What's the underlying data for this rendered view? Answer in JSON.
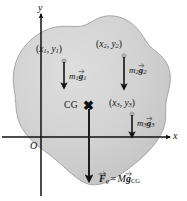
{
  "figure": {
    "background_color": "#ffffff",
    "body_fill_color": "#cccccc",
    "body_edge_color": "#9a9a9a",
    "axis_color": "#111111",
    "vector_color": "#141414"
  },
  "axes": {
    "y_label": "y",
    "x_label": "x",
    "origin_label": "O"
  },
  "cg": {
    "label": "CG",
    "marker": "✖"
  },
  "particles": [
    {
      "id": "particle-1",
      "coord_open": "(",
      "coord_x": "x",
      "coord_x_sub": "1",
      "coord_comma": ", ",
      "coord_y": "y",
      "coord_y_sub": "1",
      "coord_close": ")",
      "force_mass": "m",
      "force_mass_sub": "1",
      "force_vector": "g",
      "force_vector_sub": "1"
    },
    {
      "id": "particle-2",
      "coord_open": "(",
      "coord_x": "x",
      "coord_x_sub": "2",
      "coord_comma": ", ",
      "coord_y": "y",
      "coord_y_sub": "2",
      "coord_close": ")",
      "force_mass": "m",
      "force_mass_sub": "2",
      "force_vector": "g",
      "force_vector_sub": "2"
    },
    {
      "id": "particle-3",
      "coord_open": "(",
      "coord_x": "x",
      "coord_x_sub": "3",
      "coord_comma": ", ",
      "coord_y": "y",
      "coord_y_sub": "3",
      "coord_close": ")",
      "force_mass": "m",
      "force_mass_sub": "3",
      "force_vector": "g",
      "force_vector_sub": "3"
    }
  ],
  "resultant": {
    "force_symbol": "F",
    "force_sub": "g",
    "equals": "=",
    "mass_symbol": "M",
    "gravity_symbol": "g",
    "gravity_sub": "CG"
  }
}
